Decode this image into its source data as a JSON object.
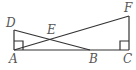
{
  "diagram": {
    "type": "geometry",
    "points": {
      "A": {
        "label": "A",
        "x": 14,
        "y": 50
      },
      "B": {
        "label": "B",
        "x": 90,
        "y": 50
      },
      "C": {
        "label": "C",
        "x": 129,
        "y": 50
      },
      "D": {
        "label": "D",
        "x": 14,
        "y": 30
      },
      "E": {
        "label": "E",
        "x": 51,
        "y": 40
      },
      "F": {
        "label": "F",
        "x": 129,
        "y": 16
      }
    },
    "segments": [
      "AC",
      "AD",
      "CF",
      "DB",
      "AF"
    ],
    "right_angles": [
      "A",
      "C"
    ],
    "colors": {
      "stroke": "#333333",
      "label": "#555555"
    }
  }
}
